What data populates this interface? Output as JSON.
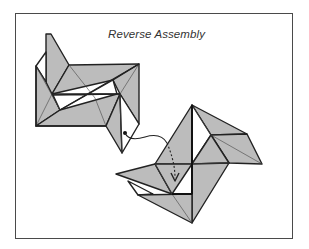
{
  "diagram": {
    "title": "Reverse Assembly",
    "type": "origami-instruction",
    "colors": {
      "paper_fill": "#bcbcbc",
      "line": "#222222",
      "frame": "#4a4a4a",
      "background": "#ffffff"
    },
    "figures": [
      {
        "id": "left-unit",
        "description": "Folded pinwheel-like unit with a pointed flap at bottom-right and an insertion point marked by a dot",
        "approx_bbox": [
          36,
          34,
          139,
          153
        ]
      },
      {
        "id": "right-unit",
        "description": "Second folded unit rotated; receives the flap via a dashed arrow into a pocket",
        "approx_bbox": [
          116,
          105,
          262,
          223
        ]
      }
    ],
    "annotations": [
      {
        "type": "dot",
        "at": [
          125,
          133
        ],
        "meaning": "insertion point on left unit"
      },
      {
        "type": "connector-curve",
        "from": [
          125,
          133
        ],
        "to": [
          167,
          143
        ]
      },
      {
        "type": "dashed-arrow",
        "from": [
          167,
          143
        ],
        "to": [
          176,
          181
        ],
        "meaning": "insert into pocket"
      }
    ]
  }
}
